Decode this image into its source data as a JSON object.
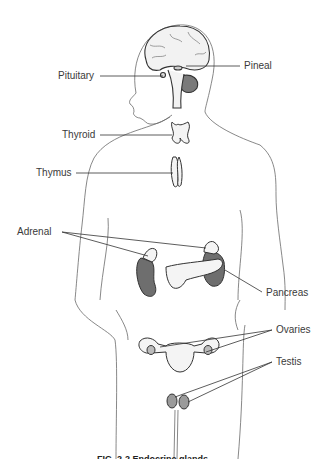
{
  "figure": {
    "type": "anatomical-diagram",
    "caption_partial": "FIG. 2-2  Endocrine glands"
  },
  "labels": [
    {
      "id": "pituitary",
      "text": "Pituitary",
      "x": 58,
      "y": 70
    },
    {
      "id": "pineal",
      "text": "Pineal",
      "x": 244,
      "y": 60
    },
    {
      "id": "thyroid",
      "text": "Thyroid",
      "x": 62,
      "y": 129
    },
    {
      "id": "thymus",
      "text": "Thymus",
      "x": 36,
      "y": 167
    },
    {
      "id": "adrenal",
      "text": "Adrenal",
      "x": 17,
      "y": 226
    },
    {
      "id": "pancreas",
      "text": "Pancreas",
      "x": 266,
      "y": 287
    },
    {
      "id": "ovaries",
      "text": "Ovaries",
      "x": 276,
      "y": 324
    },
    {
      "id": "testis",
      "text": "Testis",
      "x": 276,
      "y": 356
    }
  ],
  "colors": {
    "outline": "#555555",
    "organ_fill": "#f4f4f4",
    "organ_dark": "#6e6e6e",
    "leader_line": "#333333",
    "text": "#3a3a3a"
  }
}
